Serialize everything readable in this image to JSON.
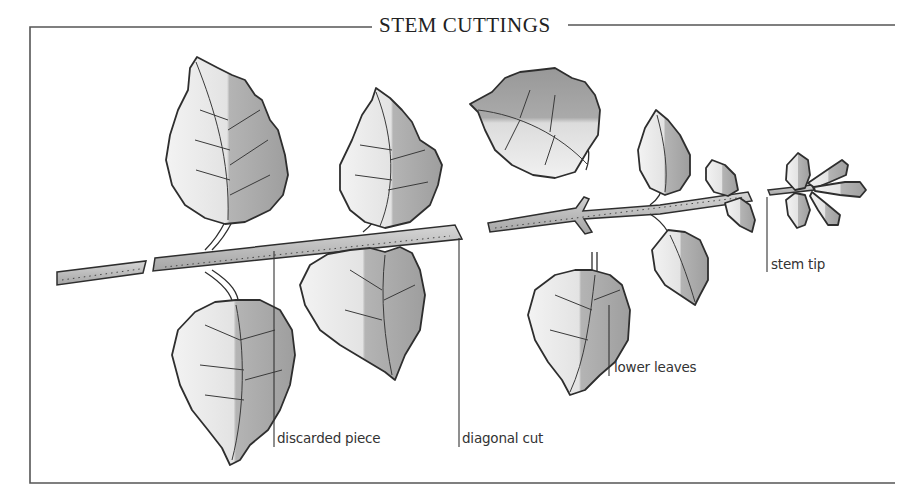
{
  "title": "STEM CUTTINGS",
  "labels": {
    "discarded_piece": "discarded piece",
    "diagonal_cut": "diagonal cut",
    "lower_leaves": "lower leaves",
    "stem_tip": "stem tip"
  },
  "colors": {
    "frame": "#555555",
    "outline": "#2e2e2e",
    "leaf_light": "#ebebeb",
    "leaf_dark": "#a9a9a9",
    "stem": "#bdbdbd",
    "text": "#333333"
  }
}
